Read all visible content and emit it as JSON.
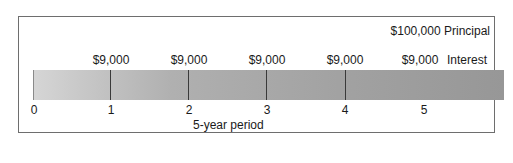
{
  "principal": {
    "amount": "$100,000",
    "label": "Principal",
    "text": "$100,000  Principal"
  },
  "interest": {
    "label": "Interest",
    "payments": [
      "$9,000",
      "$9,000",
      "$9,000",
      "$9,000",
      "$9,000"
    ]
  },
  "timeline": {
    "ticks": [
      "0",
      "1",
      "2",
      "3",
      "4",
      "5"
    ],
    "title": "5-year period"
  },
  "colors": {
    "bar_start": "#d6d6d6",
    "bar_end": "#9a9a9a",
    "tick": "#3a3a3a",
    "frame": "#6e6e6e"
  }
}
